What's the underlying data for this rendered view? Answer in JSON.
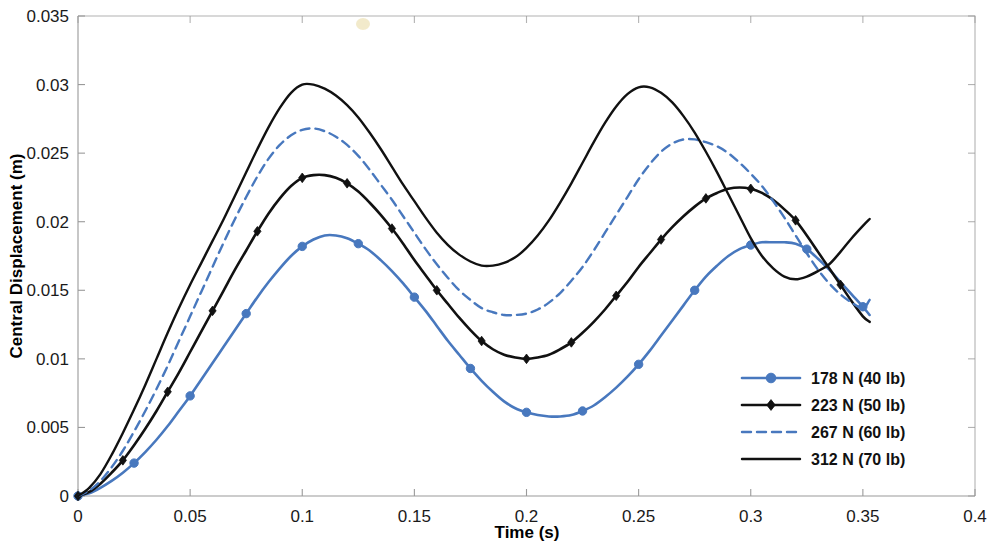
{
  "chart_data": {
    "type": "line",
    "title": "",
    "xlabel": "Time (s)",
    "ylabel": "Central Displacement (m)",
    "xlim": [
      0,
      0.4
    ],
    "ylim": [
      0,
      0.035
    ],
    "xticks": [
      "0",
      "0.05",
      "0.1",
      "0.15",
      "0.2",
      "0.25",
      "0.3",
      "0.35",
      "0.4"
    ],
    "xtick_values": [
      0,
      0.05,
      0.1,
      0.15,
      0.2,
      0.25,
      0.3,
      0.35,
      0.4
    ],
    "yticks": [
      "0",
      "0.005",
      "0.01",
      "0.015",
      "0.02",
      "0.025",
      "0.03",
      "0.035"
    ],
    "ytick_values": [
      0,
      0.005,
      0.01,
      0.015,
      0.02,
      0.025,
      0.03,
      0.035
    ],
    "grid": false,
    "legend_position": "lower-right",
    "colors": {
      "blue": "#4878be",
      "black": "#111111",
      "axis": "#9a9a9a",
      "background": "#ffffff"
    },
    "series": [
      {
        "name": "178 N (40 lb)",
        "color": "#4878be",
        "style": "solid",
        "marker": "circle",
        "line_width": 2.6,
        "marker_size": 4.2,
        "marker_step": 5,
        "x": [
          0,
          0.005,
          0.01,
          0.015,
          0.02,
          0.025,
          0.03,
          0.035,
          0.04,
          0.045,
          0.05,
          0.055,
          0.06,
          0.065,
          0.07,
          0.075,
          0.08,
          0.085,
          0.09,
          0.095,
          0.1,
          0.105,
          0.11,
          0.115,
          0.12,
          0.125,
          0.13,
          0.135,
          0.14,
          0.145,
          0.15,
          0.155,
          0.16,
          0.165,
          0.17,
          0.175,
          0.18,
          0.185,
          0.19,
          0.195,
          0.2,
          0.205,
          0.21,
          0.215,
          0.22,
          0.225,
          0.23,
          0.235,
          0.24,
          0.245,
          0.25,
          0.255,
          0.26,
          0.265,
          0.27,
          0.275,
          0.28,
          0.285,
          0.29,
          0.295,
          0.3,
          0.305,
          0.31,
          0.315,
          0.32,
          0.325,
          0.33,
          0.335,
          0.34,
          0.345,
          0.35,
          0.353
        ],
        "y": [
          0,
          0.0002,
          0.0006,
          0.0011,
          0.0017,
          0.0024,
          0.0032,
          0.0041,
          0.0051,
          0.0062,
          0.0073,
          0.0085,
          0.0097,
          0.0109,
          0.0121,
          0.0133,
          0.0145,
          0.0156,
          0.0166,
          0.0175,
          0.0182,
          0.0187,
          0.019,
          0.019,
          0.0188,
          0.0184,
          0.0179,
          0.0172,
          0.0164,
          0.0155,
          0.0145,
          0.0135,
          0.0124,
          0.0113,
          0.0103,
          0.0093,
          0.0084,
          0.0076,
          0.0069,
          0.0064,
          0.0061,
          0.0059,
          0.0058,
          0.0058,
          0.0059,
          0.0062,
          0.0066,
          0.0072,
          0.0079,
          0.0087,
          0.0096,
          0.0106,
          0.0117,
          0.0128,
          0.0139,
          0.015,
          0.016,
          0.0168,
          0.0175,
          0.018,
          0.0183,
          0.0185,
          0.0185,
          0.0185,
          0.0184,
          0.018,
          0.0173,
          0.0165,
          0.0156,
          0.0147,
          0.0138,
          0.0132
        ]
      },
      {
        "name": "223 N (50 lb)",
        "color": "#111111",
        "style": "solid",
        "marker": "diamond",
        "line_width": 2.6,
        "marker_size": 3.6,
        "marker_step": 4,
        "x": [
          0,
          0.005,
          0.01,
          0.015,
          0.02,
          0.025,
          0.03,
          0.035,
          0.04,
          0.045,
          0.05,
          0.055,
          0.06,
          0.065,
          0.07,
          0.075,
          0.08,
          0.085,
          0.09,
          0.095,
          0.1,
          0.105,
          0.11,
          0.115,
          0.12,
          0.125,
          0.13,
          0.135,
          0.14,
          0.145,
          0.15,
          0.155,
          0.16,
          0.165,
          0.17,
          0.175,
          0.18,
          0.185,
          0.19,
          0.195,
          0.2,
          0.205,
          0.21,
          0.215,
          0.22,
          0.225,
          0.23,
          0.235,
          0.24,
          0.245,
          0.25,
          0.255,
          0.26,
          0.265,
          0.27,
          0.275,
          0.28,
          0.285,
          0.29,
          0.295,
          0.3,
          0.305,
          0.31,
          0.315,
          0.32,
          0.325,
          0.33,
          0.335,
          0.34,
          0.345,
          0.35,
          0.353
        ],
        "y": [
          0,
          0.0003,
          0.0009,
          0.0017,
          0.0026,
          0.0037,
          0.0049,
          0.0062,
          0.0076,
          0.009,
          0.0105,
          0.012,
          0.0135,
          0.015,
          0.0165,
          0.0179,
          0.0193,
          0.0206,
          0.0217,
          0.0226,
          0.0232,
          0.0234,
          0.0234,
          0.0232,
          0.0228,
          0.0222,
          0.0214,
          0.0205,
          0.0195,
          0.0184,
          0.0172,
          0.0161,
          0.015,
          0.014,
          0.013,
          0.0121,
          0.0113,
          0.0107,
          0.0103,
          0.0101,
          0.01,
          0.0101,
          0.0103,
          0.0107,
          0.0112,
          0.0119,
          0.0127,
          0.0136,
          0.0146,
          0.0156,
          0.0167,
          0.0177,
          0.0187,
          0.0196,
          0.0204,
          0.0211,
          0.0217,
          0.0221,
          0.0224,
          0.0225,
          0.0224,
          0.0221,
          0.0216,
          0.0209,
          0.0201,
          0.019,
          0.0178,
          0.0166,
          0.0154,
          0.0142,
          0.0131,
          0.0127
        ]
      },
      {
        "name": "267 N (60 lb)",
        "color": "#4878be",
        "style": "dashed",
        "marker": "none",
        "line_width": 2.4,
        "marker_size": 0,
        "marker_step": 0,
        "x": [
          0,
          0.005,
          0.01,
          0.015,
          0.02,
          0.025,
          0.03,
          0.035,
          0.04,
          0.045,
          0.05,
          0.055,
          0.06,
          0.065,
          0.07,
          0.075,
          0.08,
          0.085,
          0.09,
          0.095,
          0.1,
          0.105,
          0.11,
          0.115,
          0.12,
          0.125,
          0.13,
          0.135,
          0.14,
          0.145,
          0.15,
          0.155,
          0.16,
          0.165,
          0.17,
          0.175,
          0.18,
          0.185,
          0.19,
          0.195,
          0.2,
          0.205,
          0.21,
          0.215,
          0.22,
          0.225,
          0.23,
          0.235,
          0.24,
          0.245,
          0.25,
          0.255,
          0.26,
          0.265,
          0.27,
          0.275,
          0.28,
          0.285,
          0.29,
          0.295,
          0.3,
          0.305,
          0.31,
          0.315,
          0.32,
          0.325,
          0.33,
          0.335,
          0.34,
          0.345,
          0.35,
          0.353
        ],
        "y": [
          0,
          0.0004,
          0.0011,
          0.0021,
          0.0033,
          0.0047,
          0.0062,
          0.0078,
          0.0095,
          0.0113,
          0.0131,
          0.0149,
          0.0167,
          0.0185,
          0.0202,
          0.0218,
          0.0233,
          0.0246,
          0.0256,
          0.0263,
          0.0267,
          0.0268,
          0.0266,
          0.0262,
          0.0256,
          0.0248,
          0.0238,
          0.0227,
          0.0216,
          0.0204,
          0.0192,
          0.018,
          0.0169,
          0.0159,
          0.015,
          0.0143,
          0.0137,
          0.0134,
          0.0132,
          0.0132,
          0.0133,
          0.0136,
          0.0141,
          0.0148,
          0.0157,
          0.0167,
          0.0179,
          0.0192,
          0.0205,
          0.0218,
          0.0231,
          0.0242,
          0.0251,
          0.0257,
          0.026,
          0.026,
          0.0258,
          0.0255,
          0.025,
          0.0243,
          0.0235,
          0.0226,
          0.0215,
          0.0203,
          0.019,
          0.0177,
          0.0165,
          0.0155,
          0.0147,
          0.0141,
          0.0137,
          0.0143
        ]
      },
      {
        "name": "312 N (70 lb)",
        "color": "#111111",
        "style": "solid",
        "marker": "none",
        "line_width": 2.4,
        "marker_size": 0,
        "marker_step": 0,
        "x": [
          0,
          0.005,
          0.01,
          0.015,
          0.02,
          0.025,
          0.03,
          0.035,
          0.04,
          0.045,
          0.05,
          0.055,
          0.06,
          0.065,
          0.07,
          0.075,
          0.08,
          0.085,
          0.09,
          0.095,
          0.1,
          0.105,
          0.11,
          0.115,
          0.12,
          0.125,
          0.13,
          0.135,
          0.14,
          0.145,
          0.15,
          0.155,
          0.16,
          0.165,
          0.17,
          0.175,
          0.18,
          0.185,
          0.19,
          0.195,
          0.2,
          0.205,
          0.21,
          0.215,
          0.22,
          0.225,
          0.23,
          0.235,
          0.24,
          0.245,
          0.25,
          0.255,
          0.26,
          0.265,
          0.27,
          0.275,
          0.28,
          0.285,
          0.29,
          0.295,
          0.3,
          0.305,
          0.31,
          0.315,
          0.32,
          0.325,
          0.33,
          0.335,
          0.34,
          0.345,
          0.35,
          0.353
        ],
        "y": [
          0,
          0.0006,
          0.0016,
          0.003,
          0.0046,
          0.0063,
          0.0081,
          0.01,
          0.0119,
          0.0137,
          0.0154,
          0.017,
          0.0186,
          0.0202,
          0.0219,
          0.0236,
          0.0253,
          0.0269,
          0.0283,
          0.0294,
          0.03,
          0.03,
          0.0297,
          0.0292,
          0.0285,
          0.0276,
          0.0265,
          0.0253,
          0.024,
          0.0227,
          0.0215,
          0.0203,
          0.0192,
          0.0183,
          0.0176,
          0.0171,
          0.0168,
          0.0168,
          0.017,
          0.0174,
          0.0181,
          0.019,
          0.0201,
          0.0214,
          0.0228,
          0.0243,
          0.0258,
          0.0272,
          0.0284,
          0.0293,
          0.0298,
          0.0298,
          0.0294,
          0.0287,
          0.0277,
          0.0265,
          0.0251,
          0.0236,
          0.022,
          0.0204,
          0.0188,
          0.0175,
          0.0166,
          0.016,
          0.0158,
          0.016,
          0.0164,
          0.0169,
          0.0178,
          0.0188,
          0.0197,
          0.0202
        ]
      }
    ]
  },
  "legend": {
    "entries": [
      {
        "label": "178 N (40 lb)"
      },
      {
        "label": "223 N (50 lb)"
      },
      {
        "label": "267 N (60 lb)"
      },
      {
        "label": "312 N (70 lb)"
      }
    ]
  }
}
